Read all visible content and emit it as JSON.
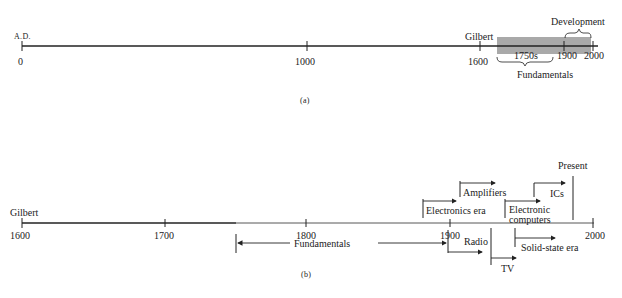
{
  "panel_a": {
    "caption": "(a)",
    "era_label": "A.D.",
    "ticks": [
      "0",
      "1000",
      "1600",
      "1750s",
      "1900",
      "2000"
    ],
    "event_gilbert": "Gilbert",
    "bracket_development": "Development",
    "bracket_fundamentals": "Fundamentals",
    "shade_color": "#a9a9a9"
  },
  "panel_b": {
    "caption": "(b)",
    "ticks": [
      "1600",
      "1700",
      "1800",
      "1900",
      "2000"
    ],
    "event_gilbert": "Gilbert",
    "labels": {
      "fundamentals": "Fundamentals",
      "electronics_era": "Electronics era",
      "amplifiers": "Amplifiers",
      "electronic_computers_line1": "Electronic",
      "electronic_computers_line2": "computers",
      "ics": "ICs",
      "present": "Present",
      "radio": "Radio",
      "tv": "TV",
      "solid_state_era": "Solid-state era"
    }
  }
}
